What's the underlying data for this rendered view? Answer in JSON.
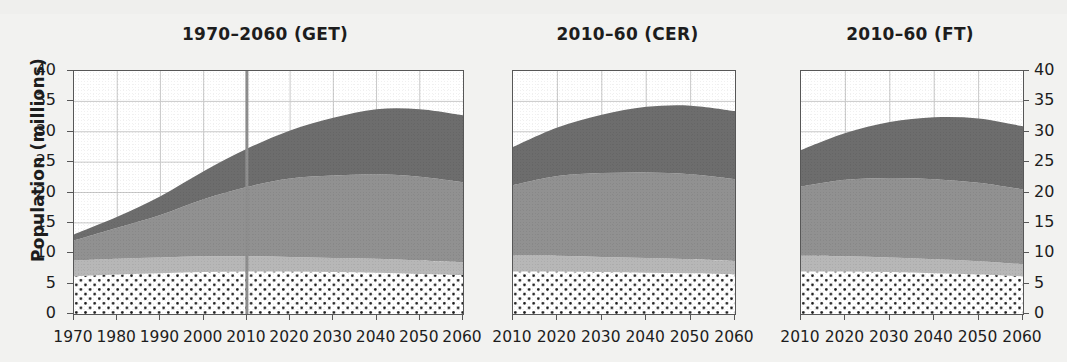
{
  "figure": {
    "ylabel": "Population (millions)",
    "y_ticks": [
      "40",
      "35",
      "30",
      "25",
      "20",
      "15",
      "10",
      "5",
      "0"
    ],
    "y_ticks_right": [
      "40",
      "35",
      "30",
      "25",
      "20",
      "15",
      "10",
      "5",
      "0"
    ]
  },
  "panels": [
    {
      "title": "1970–2060 (GET)",
      "x_ticks": [
        "1970",
        "1980",
        "1990",
        "2000",
        "2010",
        "2020",
        "2030",
        "2040",
        "2050",
        "2060"
      ]
    },
    {
      "title": "2010–60 (CER)",
      "x_ticks": [
        "2010",
        "2020",
        "2030",
        "2040",
        "2050",
        "2060"
      ]
    },
    {
      "title": "2010–60 (FT)",
      "x_ticks": [
        "2010",
        "2020",
        "2030",
        "2040",
        "2050",
        "2060"
      ]
    }
  ],
  "colors": {
    "series_dark": "#6d6d6d",
    "series_medium": "#919191",
    "series_light": "#b7b7b7",
    "series_dotted_fill": "#ffffff",
    "series_dotted_dots": "#1a1a1a",
    "axis": "#575757",
    "grid": "#c9c9c9",
    "marker_line": "#8e8e8e",
    "background": "#f2f2f0",
    "text": "#1d1d1d"
  },
  "chart_data": {
    "type": "area",
    "title": "",
    "xlabel": "",
    "ylabel": "Population (millions)",
    "ylim": [
      0,
      40
    ],
    "grid": true,
    "legend": "none",
    "stacked": true,
    "units": "millions of people",
    "annotations": [
      {
        "panel": 0,
        "type": "vertical-line",
        "x": 2010,
        "label": ""
      }
    ],
    "panels": [
      {
        "title": "1970–2060 (GET)",
        "xlim": [
          1970,
          2060
        ],
        "x": [
          1970,
          1980,
          1990,
          2000,
          2010,
          2020,
          2030,
          2040,
          2050,
          2060
        ],
        "series": [
          {
            "name": "band-1-dotted",
            "style": "white-dotted",
            "values": [
              6.2,
              6.5,
              6.7,
              6.9,
              7.0,
              7.0,
              6.9,
              6.8,
              6.6,
              6.4
            ]
          },
          {
            "name": "band-2-light-grey",
            "style": "light-grey",
            "values": [
              2.6,
              2.6,
              2.6,
              2.6,
              2.5,
              2.4,
              2.3,
              2.3,
              2.2,
              2.1
            ]
          },
          {
            "name": "band-3-medium-grey",
            "style": "medium-grey",
            "values": [
              3.3,
              5.1,
              7.0,
              9.4,
              11.4,
              12.9,
              13.6,
              13.9,
              13.8,
              13.2
            ]
          },
          {
            "name": "band-4-dark-grey",
            "style": "dark-grey",
            "values": [
              1.0,
              1.8,
              3.1,
              4.6,
              6.3,
              7.9,
              9.5,
              10.7,
              11.1,
              11.0
            ]
          }
        ],
        "totals": [
          13.1,
          16.0,
          19.4,
          23.5,
          27.2,
          30.2,
          32.3,
          33.7,
          33.7,
          32.7
        ]
      },
      {
        "title": "2010–60 (CER)",
        "xlim": [
          2010,
          2060
        ],
        "x": [
          2010,
          2020,
          2030,
          2040,
          2050,
          2060
        ],
        "series": [
          {
            "name": "band-1-dotted",
            "style": "white-dotted",
            "values": [
              7.0,
              7.0,
              6.9,
              6.8,
              6.7,
              6.5
            ]
          },
          {
            "name": "band-2-light-grey",
            "style": "light-grey",
            "values": [
              2.6,
              2.6,
              2.5,
              2.4,
              2.3,
              2.2
            ]
          },
          {
            "name": "band-3-medium-grey",
            "style": "medium-grey",
            "values": [
              11.6,
              13.1,
              13.8,
              14.1,
              14.0,
              13.5
            ]
          },
          {
            "name": "band-4-dark-grey",
            "style": "dark-grey",
            "values": [
              6.3,
              8.0,
              9.6,
              10.8,
              11.3,
              11.2
            ]
          }
        ],
        "totals": [
          27.5,
          30.7,
          32.8,
          34.1,
          34.3,
          33.4
        ]
      },
      {
        "title": "2010–60 (FT)",
        "xlim": [
          2010,
          2060
        ],
        "x": [
          2010,
          2020,
          2030,
          2040,
          2050,
          2060
        ],
        "series": [
          {
            "name": "band-1-dotted",
            "style": "white-dotted",
            "values": [
              7.0,
              7.0,
              6.9,
              6.7,
              6.5,
              6.2
            ]
          },
          {
            "name": "band-2-light-grey",
            "style": "light-grey",
            "values": [
              2.6,
              2.5,
              2.4,
              2.3,
              2.2,
              2.0
            ]
          },
          {
            "name": "band-3-medium-grey",
            "style": "medium-grey",
            "values": [
              11.4,
              12.6,
              13.1,
              13.2,
              12.9,
              12.3
            ]
          },
          {
            "name": "band-4-dark-grey",
            "style": "dark-grey",
            "values": [
              6.0,
              7.7,
              9.2,
              10.2,
              10.6,
              10.4
            ]
          }
        ],
        "totals": [
          27.0,
          29.8,
          31.6,
          32.4,
          32.2,
          30.9
        ]
      }
    ]
  }
}
